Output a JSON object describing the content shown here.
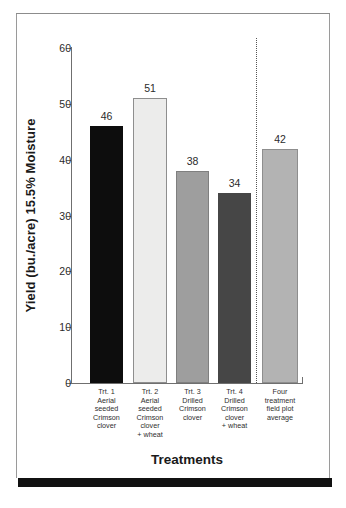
{
  "chart_data": {
    "type": "bar",
    "title": "",
    "xlabel": "Treatments",
    "ylabel": "Yield (bu./acre) 15.5% Moisture",
    "ylim": [
      0,
      60
    ],
    "yticks": [
      "0",
      "10",
      "20",
      "30",
      "40",
      "50",
      "60"
    ],
    "grid": false,
    "legend": "none",
    "categories": [
      "Trt. 1\nAerial\nseeded\nCrimson\nclover",
      "Trt. 2\nAerial\nseeded\nCrimson\nclover\n+ wheat",
      "Trt. 3\nDrilled\nCrimson\nclover",
      "Trt. 4\nDrilled\nCrimson\nclover\n+ wheat",
      "Four\ntreatment\nfield plot\naverage"
    ],
    "values": [
      46,
      51,
      38,
      34,
      42
    ],
    "value_labels": [
      "46",
      "51",
      "38",
      "34",
      "42"
    ],
    "bar_colors": [
      "#0d0d0d",
      "#ececeb",
      "#9e9e9e",
      "#464646",
      "#b3b3b3"
    ],
    "bar_border_colors": [
      "#0d0d0d",
      "#8e8e8e",
      "#7f7f7f",
      "#464646",
      "#8e8e8e"
    ],
    "annotations": [
      {
        "name": "group-separator",
        "type": "vertical-dotted-line",
        "note": "separates the four treatments from the four-treatment field plot average"
      }
    ]
  },
  "axis": {
    "y_title": "Yield (bu./acre) 15.5% Moisture",
    "x_title": "Treatments"
  }
}
